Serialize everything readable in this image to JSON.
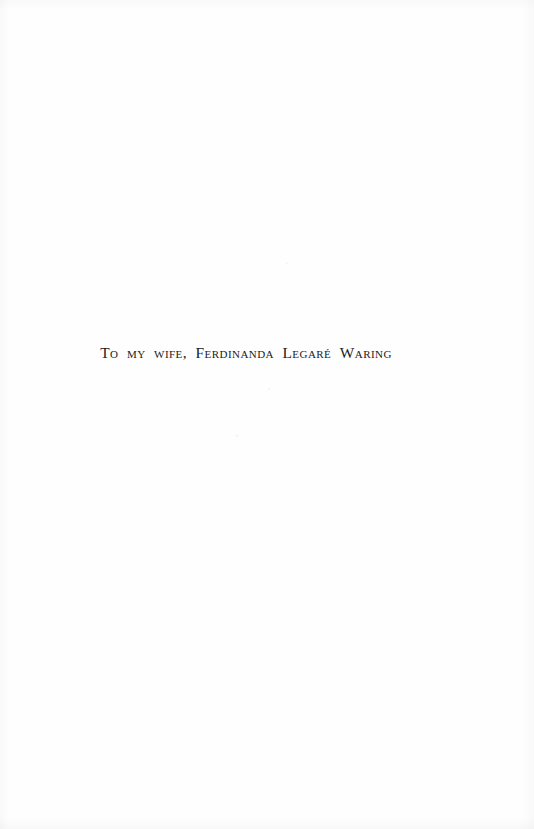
{
  "page": {
    "kind": "book-dedication-page",
    "background_color": "#fefefe",
    "ink_color": "#1b1b22",
    "width": 534,
    "height": 829
  },
  "dedication": {
    "full_text": "To my wife, Ferdinanda Legaré Waring",
    "segments": [
      {
        "lead": "T",
        "rest": "o"
      },
      {
        "lead": "",
        "rest": "my"
      },
      {
        "lead": "",
        "rest": "wife,"
      },
      {
        "lead": "F",
        "rest": "erdinanda"
      },
      {
        "lead": "L",
        "rest": "egaré"
      },
      {
        "lead": "W",
        "rest": "aring"
      }
    ],
    "words": [
      "To",
      "my",
      "wife,",
      "Ferdinanda",
      "Legaré",
      "Waring"
    ],
    "dedicatee": "Ferdinanda Legaré Waring",
    "style": "small-caps"
  }
}
